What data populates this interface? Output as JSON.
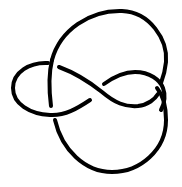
{
  "diagram": {
    "type": "knot-diagram",
    "crossings": 4,
    "stroke_color": "#000000",
    "background": "#ffffff"
  }
}
